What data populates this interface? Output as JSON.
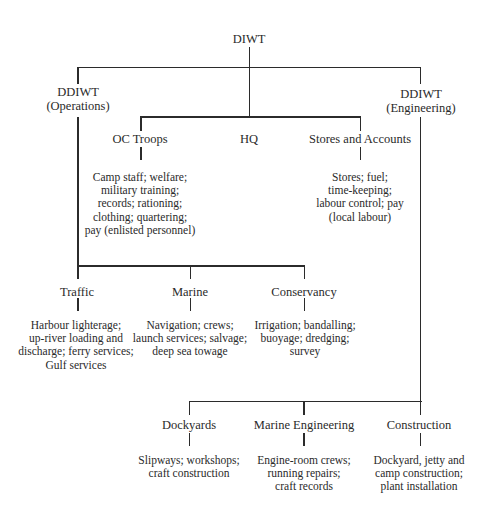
{
  "diagram": {
    "type": "org-chart",
    "root": {
      "label": "DIWT"
    },
    "deputies": {
      "operations": {
        "line1": "DDIWT",
        "line2": "(Operations)"
      },
      "engineering": {
        "line1": "DDIWT",
        "line2": "(Engineering)"
      }
    },
    "middle": [
      {
        "label": "OC Troops",
        "desc": [
          "Camp staff; welfare;",
          "military training;",
          "records; rationing;",
          "clothing; quartering;",
          "pay (enlisted personnel)"
        ]
      },
      {
        "label": "HQ",
        "desc": []
      },
      {
        "label": "Stores and Accounts",
        "desc": [
          "Stores; fuel;",
          "time-keeping;",
          "labour control; pay",
          "(local labour)"
        ]
      }
    ],
    "operations_branches": [
      {
        "label": "Traffic",
        "desc": [
          "Harbour lighterage;",
          "up-river loading and",
          "discharge; ferry services;",
          "Gulf services"
        ]
      },
      {
        "label": "Marine",
        "desc": [
          "Navigation; crews;",
          "launch services; salvage;",
          "deep sea towage"
        ]
      },
      {
        "label": "Conservancy",
        "desc": [
          "Irrigation; bandalling;",
          "buoyage; dredging;",
          "survey"
        ]
      }
    ],
    "engineering_branches": [
      {
        "label": "Dockyards",
        "desc": [
          "Slipways; workshops;",
          "craft construction"
        ]
      },
      {
        "label": "Marine Engineering",
        "desc": [
          "Engine-room crews;",
          "running repairs;",
          "craft records"
        ]
      },
      {
        "label": "Construction",
        "desc": [
          "Dockyard, jetty and",
          "camp construction;",
          "plant installation"
        ]
      }
    ],
    "colors": {
      "background": "#ffffff",
      "line": "#2b2b2b",
      "text": "#2a2a2a"
    }
  }
}
